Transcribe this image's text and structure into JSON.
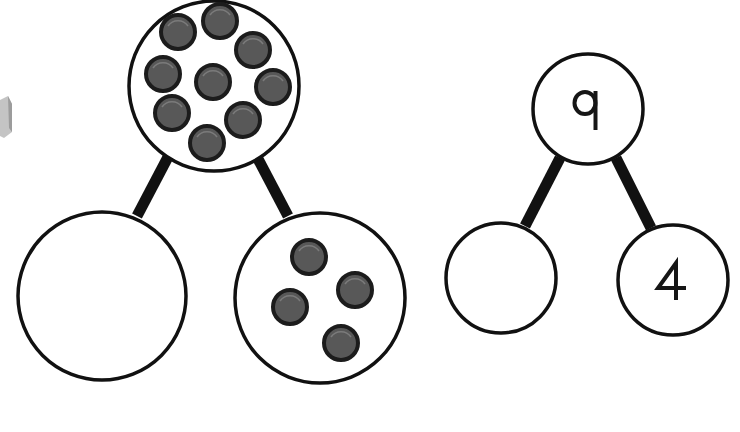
{
  "colors": {
    "background": "#ffffff",
    "outline": "#111111",
    "counter_fill": "#585858",
    "counter_stroke": "#1c1c1c",
    "counter_highlight": "#8a8a8a",
    "edge_object": "#bdbdbd"
  },
  "counter_model": {
    "whole": {
      "label": "whole",
      "counter_count": 9
    },
    "part_left": {
      "label": "part",
      "counter_count": 0
    },
    "part_right": {
      "label": "part",
      "counter_count": 4
    }
  },
  "number_model": {
    "whole": {
      "value": "9"
    },
    "part_left": {
      "value": ""
    },
    "part_right": {
      "value": "4"
    }
  }
}
